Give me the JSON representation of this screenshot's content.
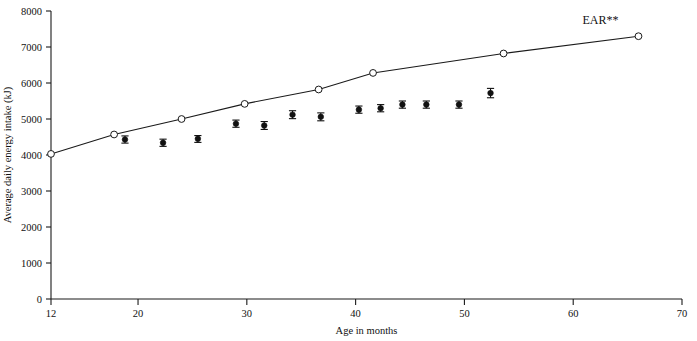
{
  "figure": {
    "clipped_title_fragment": "",
    "background_color": "#ffffff",
    "ink_color": "#111111"
  },
  "chart_data": {
    "type": "scatter",
    "title": "",
    "xlabel": "Age in months",
    "ylabel": "Average daily energy intake (kJ)",
    "xlim": [
      12,
      70
    ],
    "ylim": [
      0,
      8000
    ],
    "xticks": [
      12,
      20,
      30,
      40,
      50,
      60,
      70
    ],
    "xtick_labels": [
      "12",
      "20",
      "30",
      "40",
      "50",
      "60",
      "70"
    ],
    "yticks": [
      0,
      1000,
      2000,
      3000,
      4000,
      5000,
      6000,
      7000,
      8000
    ],
    "ytick_labels": [
      "0",
      "1000",
      "2000",
      "3000",
      "4000",
      "5000",
      "6000",
      "7000",
      "8000"
    ],
    "grid": false,
    "legend_position": "inline-annotation",
    "annotations": [
      {
        "text": "EAR**",
        "x": 62.5,
        "y": 7640
      }
    ],
    "series": [
      {
        "name": "EAR**",
        "type": "line",
        "marker": "open-circle",
        "line_visible": true,
        "x": [
          12,
          17.8,
          24.0,
          29.8,
          36.6,
          41.6,
          53.6,
          66.0
        ],
        "values": [
          4030,
          4570,
          5000,
          5420,
          5820,
          6280,
          6820,
          7300
        ]
      },
      {
        "name": "Average daily energy intake",
        "type": "scatter",
        "marker": "filled-circle",
        "line_visible": false,
        "error_bars": true,
        "x": [
          18.8,
          22.3,
          25.5,
          29.0,
          31.6,
          34.2,
          36.8,
          40.3,
          42.3,
          44.3,
          46.5,
          49.5,
          52.4
        ],
        "values": [
          4430,
          4340,
          4450,
          4870,
          4820,
          5120,
          5060,
          5260,
          5300,
          5400,
          5400,
          5400,
          5720
        ],
        "error_high": [
          4530,
          4440,
          4540,
          4970,
          4930,
          5230,
          5170,
          5360,
          5400,
          5500,
          5500,
          5500,
          5850
        ],
        "error_low": [
          4330,
          4240,
          4350,
          4770,
          4710,
          5010,
          4950,
          5160,
          5200,
          5300,
          5300,
          5300,
          5590
        ]
      }
    ]
  }
}
